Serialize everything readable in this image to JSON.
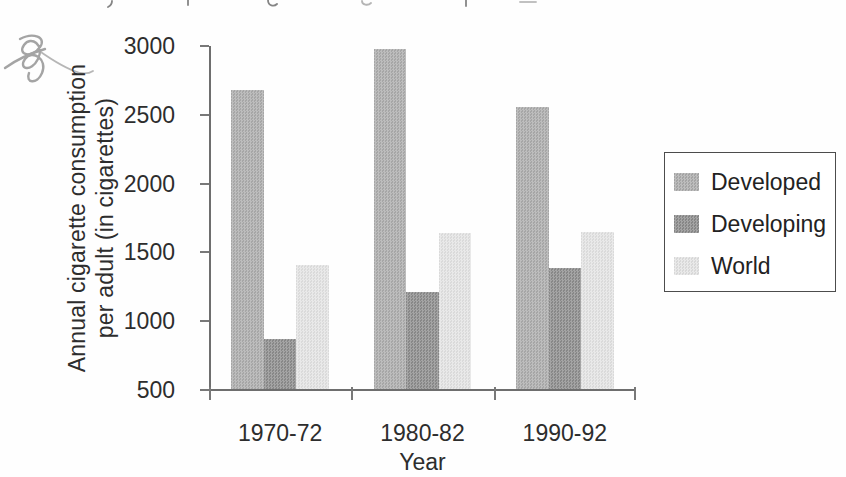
{
  "chart_data": {
    "type": "bar",
    "title": "",
    "categories": [
      "1970-72",
      "1980-82",
      "1990-92"
    ],
    "series": [
      {
        "name": "Developed",
        "color": "#adadad",
        "values": [
          2680,
          2980,
          2560
        ]
      },
      {
        "name": "Developing",
        "color": "#8d8d8d",
        "values": [
          870,
          1210,
          1390
        ]
      },
      {
        "name": "World",
        "color": "#e4e4e4",
        "values": [
          1410,
          1640,
          1650
        ]
      }
    ],
    "xlabel": "Year",
    "ylabel": "Annual cigarette consumption per adult (in cigarettes)",
    "ylabel_lines": [
      "Annual cigarette consumption",
      "per adult (in cigarettes)"
    ],
    "ylim": [
      500,
      3000
    ],
    "yticks": [
      500,
      1000,
      1500,
      2000,
      2500,
      3000
    ],
    "grid": false,
    "legend_position": "right",
    "legend_items": [
      "Developed",
      "Developing",
      "World"
    ]
  },
  "style": {
    "axis_color": "#6e6e6e",
    "text_color": "#2d2d2d",
    "scribble_color": "#9b9b9b",
    "legend_border_color": "#4c4c4c"
  }
}
